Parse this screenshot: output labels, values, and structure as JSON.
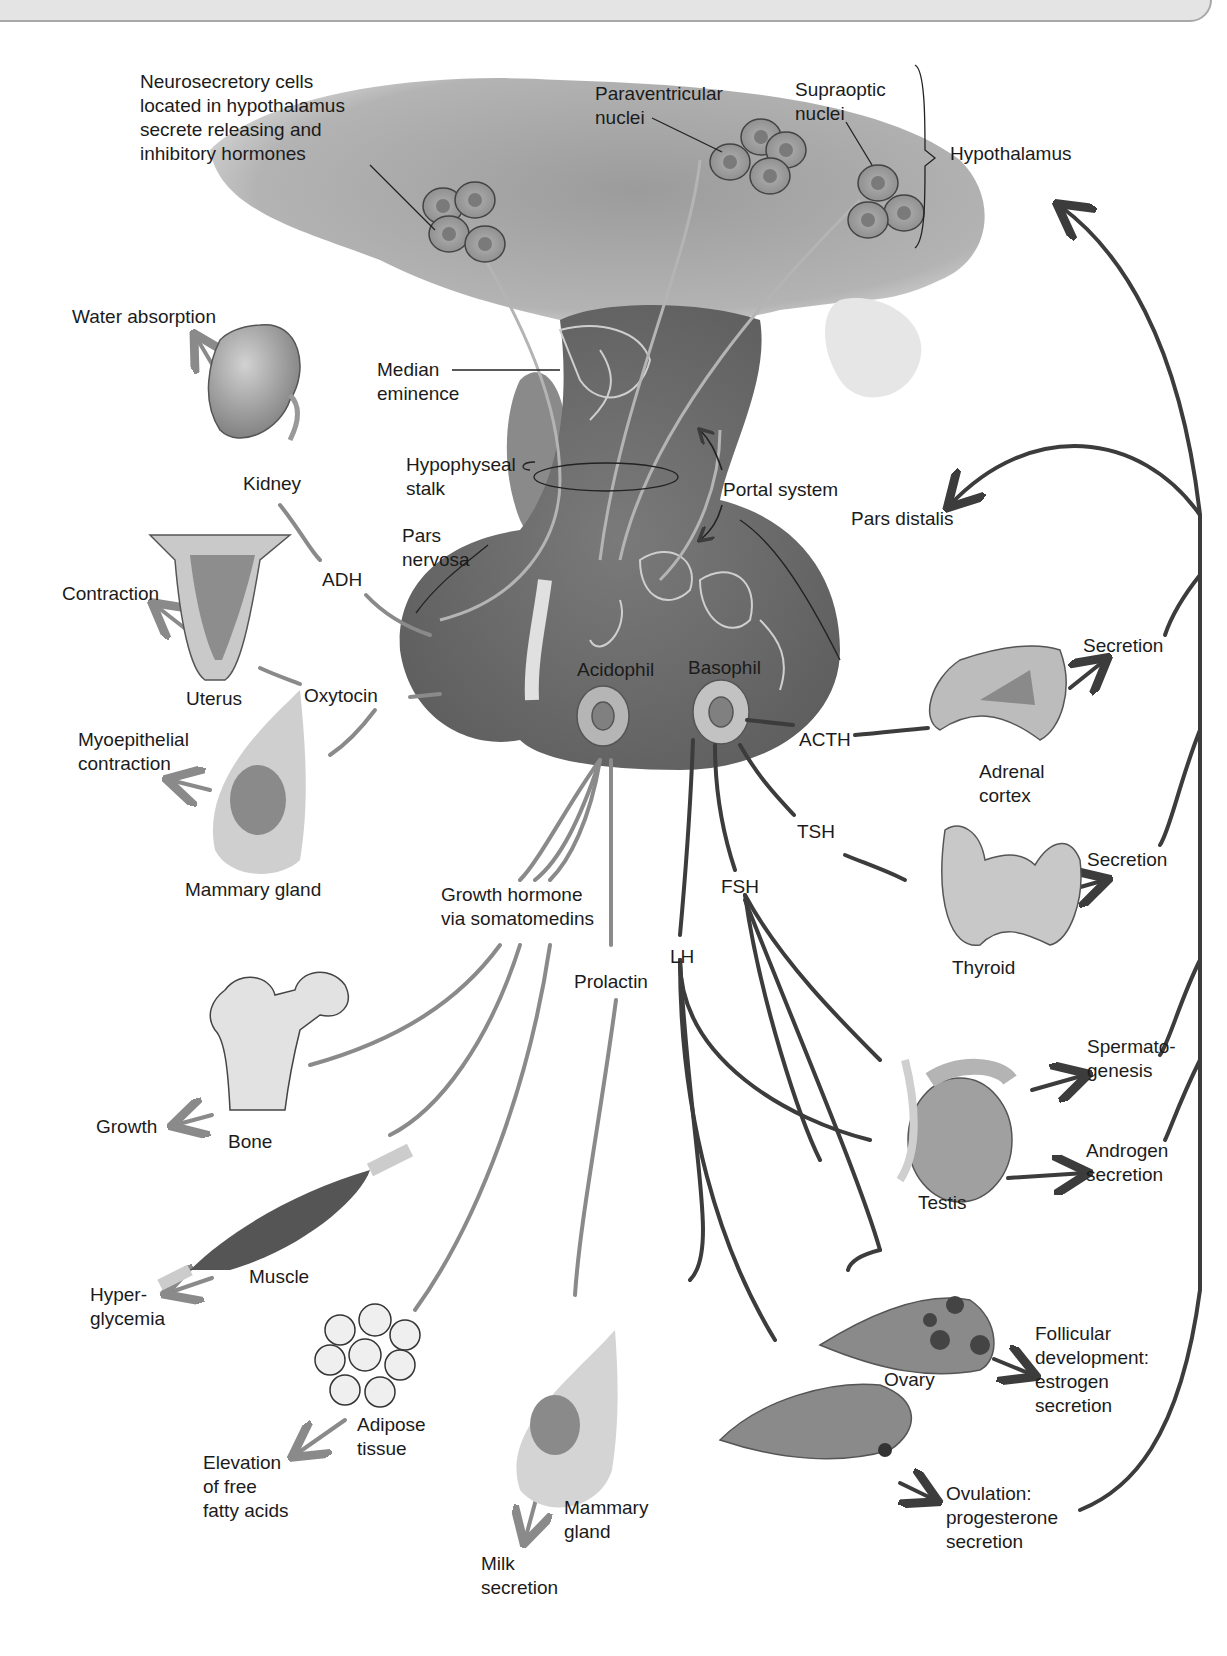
{
  "header": {
    "title": ""
  },
  "regions": {
    "hypothalamus": "Hypothalamus",
    "neurosecretory": "Neurosecretory cells\nlocated in hypothalamus\nsecrete releasing and\ninhibitory hormones",
    "paraventricular": "Paraventricular\nnuclei",
    "supraoptic": "Supraoptic\nnuclei",
    "median_eminence": "Median\neminence",
    "hypophyseal_stalk": "Hypophyseal\nstalk",
    "portal_system": "Portal system",
    "pars_distalis": "Pars distalis",
    "pars_nervosa": "Pars\nnervosa",
    "acidophil": "Acidophil",
    "basophil": "Basophil"
  },
  "hormones": {
    "adh": "ADH",
    "oxytocin": "Oxytocin",
    "acth": "ACTH",
    "tsh": "TSH",
    "fsh": "FSH",
    "lh": "LH",
    "growth_hormone": "Growth hormone\nvia somatomedins",
    "prolactin": "Prolactin"
  },
  "targets": {
    "kidney": "Kidney",
    "uterus": "Uterus",
    "mammary_gland_left": "Mammary gland",
    "bone": "Bone",
    "muscle": "Muscle",
    "adipose": "Adipose\ntissue",
    "mammary_gland_bottom": "Mammary\ngland",
    "adrenal": "Adrenal\ncortex",
    "thyroid": "Thyroid",
    "testis": "Testis",
    "ovary": "Ovary"
  },
  "effects": {
    "water_absorption": "Water absorption",
    "contraction": "Contraction",
    "myoepithelial": "Myoepithelial\ncontraction",
    "growth": "Growth",
    "hyperglycemia": "Hyper-\nglycemia",
    "fatty_acids": "Elevation\nof free\nfatty acids",
    "milk": "Milk\nsecretion",
    "adrenal_secretion": "Secretion",
    "thyroid_secretion": "Secretion",
    "spermatogenesis": "Spermato-\ngenesis",
    "androgen": "Androgen\nsecretion",
    "follicular": "Follicular\ndevelopment:\nestrogen\nsecretion",
    "ovulation": "Ovulation:\nprogesterone\nsecretion"
  },
  "colors": {
    "gland_dark": "#6e6e6e",
    "gland_mid": "#8c8c8c",
    "hypothalamus_fill": "#9a9a9a",
    "line_light": "#8a8a8a",
    "line_dark": "#3c3c3c",
    "organ_fill": "#a8a8a8",
    "header_bg": "#e4e4e4"
  }
}
